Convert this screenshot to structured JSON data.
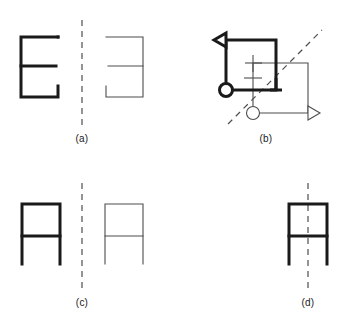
{
  "figure": {
    "background_color": "#ffffff",
    "thick_stroke_color": "#1a1a1a",
    "thin_stroke_color": "#4d4d4d",
    "dashed_line_color": "#4d4d4d",
    "label_color": "#1a1a1a",
    "thick_stroke_width": 3,
    "thin_stroke_width": 1.1,
    "dash_pattern": "6 5"
  },
  "panels": [
    {
      "id": "a",
      "label": "(a)",
      "mirror_line": {
        "orientation": "vertical",
        "x1": 82,
        "y1": 20,
        "x2": 82,
        "y2": 128
      },
      "object_shape": "letter-E",
      "object_stroke": "thick",
      "image_shape": "letter-E-mirrored",
      "image_stroke": "thin",
      "object_bounds": {
        "x": 20,
        "y": 36,
        "width": 38,
        "height": 62
      },
      "image_bounds": {
        "x": 106,
        "y": 36,
        "width": 38,
        "height": 62
      }
    },
    {
      "id": "b",
      "label": "(b)",
      "mirror_line": {
        "orientation": "diagonal",
        "x1": 231,
        "y1": 121,
        "x2": 319,
        "y2": 32
      },
      "object_shape": "flag-square-with-circle",
      "object_stroke": "thick",
      "image_shape": "flag-square-with-circle-mirrored",
      "image_stroke": "thin",
      "object_bounds": {
        "x": 224,
        "y": 34,
        "width": 48,
        "height": 58
      },
      "image_bounds": {
        "x": 252,
        "y": 62,
        "width": 58,
        "height": 54
      }
    },
    {
      "id": "c",
      "label": "(c)",
      "mirror_line": {
        "orientation": "vertical",
        "x1": 82,
        "y1": 183,
        "x2": 82,
        "y2": 292
      },
      "object_shape": "letter-A-table",
      "object_stroke": "thick",
      "image_shape": "letter-A-table-mirrored",
      "image_stroke": "thin",
      "object_bounds": {
        "x": 21,
        "y": 202,
        "width": 40,
        "height": 62
      },
      "image_bounds": {
        "x": 106,
        "y": 202,
        "width": 40,
        "height": 62
      }
    },
    {
      "id": "d",
      "label": "(d)",
      "mirror_line": {
        "orientation": "vertical",
        "x1": 308,
        "y1": 183,
        "x2": 308,
        "y2": 292
      },
      "object_shape": "letter-A-table-on-axis",
      "object_stroke": "thick",
      "image_shape": "none",
      "image_stroke": "none",
      "object_bounds": {
        "x": 288,
        "y": 202,
        "width": 40,
        "height": 62
      }
    }
  ],
  "labels": {
    "a": "(a)",
    "b": "(b)",
    "c": "(c)",
    "d": "(d)"
  }
}
